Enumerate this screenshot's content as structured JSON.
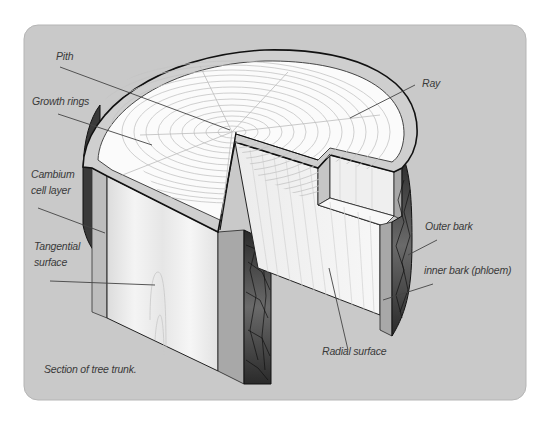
{
  "figure": {
    "caption": "Section of tree trunk.",
    "panel_color": "#c9c9c9",
    "labels": {
      "pith": "Pith",
      "growth_rings": "Growth rings",
      "cambium_line1": "Cambium",
      "cambium_line2": "cell layer",
      "tangential_line1": "Tangential",
      "tangential_line2": "surface",
      "ray": "Ray",
      "outer_bark": "Outer bark",
      "inner_bark": "inner bark (phloem)",
      "radial_surface": "Radial surface"
    }
  }
}
